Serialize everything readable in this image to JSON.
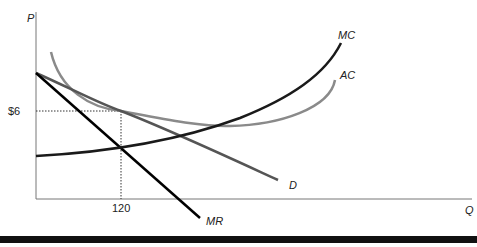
{
  "diagram": {
    "type": "monopolistic-competition-cost-revenue",
    "axes": {
      "y_label": "P",
      "x_label": "Q"
    },
    "markers": {
      "price_label": "$6",
      "quantity_label": "120"
    },
    "curves": [
      {
        "id": "MC",
        "label": "MC",
        "color": "#1a1a1a"
      },
      {
        "id": "AC",
        "label": "AC",
        "color": "#8a8a8a"
      },
      {
        "id": "D",
        "label": "D",
        "color": "#555555"
      },
      {
        "id": "MR",
        "label": "MR",
        "color": "#000000"
      }
    ],
    "colors": {
      "axis": "#777777",
      "guide_dashed": "#333333",
      "bottom_bar": "#111111"
    }
  }
}
